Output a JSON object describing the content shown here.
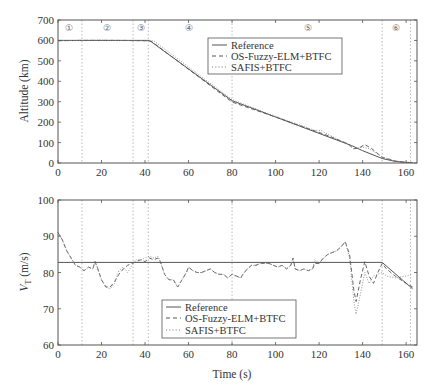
{
  "chart_data": [
    {
      "type": "line",
      "title": "",
      "xlabel": "",
      "ylabel": "Altitude (km)",
      "xlim": [
        0,
        165
      ],
      "ylim": [
        0,
        700
      ],
      "xticks": [
        0,
        20,
        40,
        60,
        80,
        100,
        120,
        140,
        160
      ],
      "yticks": [
        0,
        100,
        200,
        300,
        400,
        500,
        600,
        700
      ],
      "grid": false,
      "legend_position": "upper right",
      "phase_lines_x": [
        11,
        34.5,
        41.5,
        80,
        149,
        162
      ],
      "phase_labels": [
        {
          "label": "①",
          "x": 5
        },
        {
          "label": "②",
          "x": 22.5
        },
        {
          "label": "③",
          "x": 38
        },
        {
          "label": "④",
          "x": 60
        },
        {
          "label": "⑤",
          "x": 115
        },
        {
          "label": "⑥",
          "x": 155.5
        }
      ],
      "series": [
        {
          "name": "Reference",
          "style": "solid",
          "x": [
            0,
            42,
            80,
            100,
            120,
            135,
            140,
            149,
            155,
            160,
            163
          ],
          "y": [
            600,
            600,
            305,
            225,
            145,
            85,
            60,
            22,
            8,
            3,
            2
          ]
        },
        {
          "name": "OS-Fuzzy-ELM+BTFC",
          "style": "dashed",
          "x": [
            0,
            10,
            20,
            30,
            41,
            43,
            80,
            100,
            115,
            120,
            125,
            133,
            136,
            138,
            141,
            144,
            149,
            155,
            160,
            163
          ],
          "y": [
            598,
            600,
            600,
            600,
            598,
            595,
            298,
            225,
            168,
            150,
            130,
            95,
            70,
            72,
            90,
            72,
            28,
            10,
            3,
            2
          ]
        },
        {
          "name": "SAFIS+BTFC",
          "style": "dotted",
          "x": [
            0,
            10,
            20,
            30,
            41,
            44,
            80,
            100,
            118,
            121,
            125,
            133,
            136,
            140,
            143,
            149,
            155,
            160,
            163
          ],
          "y": [
            600,
            600,
            601,
            599,
            598,
            598,
            310,
            228,
            160,
            158,
            135,
            92,
            68,
            78,
            70,
            30,
            10,
            3,
            2
          ]
        }
      ]
    },
    {
      "type": "line",
      "title": "",
      "xlabel": "Time (s)",
      "ylabel": "V_T (m/s)",
      "ylabel_main": "V",
      "ylabel_sub": "T",
      "ylabel_unit": " (m/s)",
      "xlim": [
        0,
        165
      ],
      "ylim": [
        60,
        100
      ],
      "xticks": [
        0,
        20,
        40,
        60,
        80,
        100,
        120,
        140,
        160
      ],
      "yticks": [
        60,
        70,
        80,
        90,
        100
      ],
      "grid": false,
      "legend_position": "lower center",
      "phase_lines_x": [
        11,
        34.5,
        41.5,
        80,
        149,
        162
      ],
      "series": [
        {
          "name": "Reference",
          "style": "solid",
          "x": [
            0,
            149,
            163
          ],
          "y": [
            82.8,
            82.8,
            75.5
          ]
        },
        {
          "name": "OS-Fuzzy-ELM+BTFC",
          "style": "dashed",
          "x": [
            0,
            2,
            4,
            6,
            8,
            10,
            12,
            14,
            16,
            17,
            18,
            20,
            22,
            24,
            26,
            28,
            30,
            32,
            34,
            36,
            38,
            40,
            42,
            44,
            46,
            47,
            49,
            51,
            53,
            55,
            57,
            59,
            60,
            62,
            64,
            66,
            68,
            70,
            72,
            74,
            76,
            78,
            80,
            82,
            84,
            85,
            87,
            89,
            91,
            93,
            95,
            97,
            99,
            101,
            103,
            105,
            107,
            108,
            109,
            111,
            113,
            115,
            117,
            118,
            120,
            122,
            124,
            126,
            128,
            130,
            132,
            134,
            136,
            137,
            139,
            141,
            143,
            145,
            147,
            149,
            151,
            155,
            160,
            163
          ],
          "y": [
            91,
            89,
            86,
            84,
            82,
            81.5,
            80.5,
            81.5,
            81,
            83,
            81.5,
            78,
            76,
            76,
            77.5,
            79.5,
            81,
            82,
            82.5,
            83,
            83.5,
            83,
            84,
            83.5,
            84,
            83,
            79.5,
            78,
            78,
            76,
            78,
            80,
            81.5,
            80.5,
            80,
            80,
            80.5,
            81,
            80,
            79.5,
            79.5,
            78.5,
            79.5,
            79,
            78.5,
            79.5,
            81,
            82,
            82,
            82.5,
            82.5,
            82.5,
            82,
            81.5,
            82,
            81,
            82,
            84,
            81,
            80.5,
            81,
            80.5,
            81,
            82.5,
            82.5,
            84,
            85,
            85.5,
            86,
            87,
            88.5,
            85,
            75,
            72,
            78,
            83,
            79,
            77,
            80,
            82.5,
            81,
            79,
            77,
            76
          ]
        },
        {
          "name": "SAFIS+BTFC",
          "style": "dotted",
          "x": [
            0,
            2,
            4,
            6,
            8,
            10,
            12,
            14,
            16,
            17,
            18,
            20,
            22,
            24,
            26,
            28,
            30,
            32,
            34,
            36,
            38,
            40,
            42,
            44,
            46,
            47,
            49,
            51,
            53,
            55,
            57,
            59,
            60,
            62,
            64,
            66,
            68,
            70,
            72,
            74,
            76,
            78,
            80,
            82,
            84,
            85,
            87,
            89,
            91,
            93,
            95,
            97,
            99,
            101,
            103,
            105,
            107,
            108,
            109,
            111,
            113,
            115,
            117,
            118,
            120,
            122,
            124,
            126,
            128,
            130,
            132,
            134,
            136,
            137,
            139,
            141,
            143,
            145,
            147,
            149,
            151,
            155,
            160,
            163
          ],
          "y": [
            91,
            89,
            86,
            84,
            82,
            81.5,
            80.5,
            81.5,
            81,
            83,
            81.5,
            78,
            76,
            75.5,
            77,
            80.5,
            81.5,
            80,
            82,
            83.5,
            83.5,
            84,
            84.5,
            84,
            84.5,
            83,
            79.5,
            78,
            78,
            76,
            78,
            80,
            81.5,
            80.5,
            80,
            80,
            80.5,
            81,
            80,
            79.5,
            79.5,
            78.5,
            79.5,
            79,
            78.5,
            79.5,
            81,
            82,
            82,
            82.5,
            82.5,
            82.5,
            82,
            81.5,
            82,
            81,
            82,
            84,
            81,
            80.5,
            81,
            80.5,
            81,
            83.5,
            82.5,
            84,
            85,
            85.5,
            86,
            87,
            88.5,
            84,
            72,
            68.5,
            74,
            80,
            77,
            79,
            79.5,
            80,
            79,
            78.5,
            79,
            79.5
          ]
        }
      ]
    }
  ],
  "top": {
    "ylabel": "Altitude (km)",
    "legend": [
      "Reference",
      "OS-Fuzzy-ELM+BTFC",
      "SAFIS+BTFC"
    ]
  },
  "bottom": {
    "xlabel": "Time (s)",
    "legend": [
      "Reference",
      "OS-Fuzzy-ELM+BTFC",
      "SAFIS+BTFC"
    ]
  },
  "colors": {
    "reference": "#555555",
    "fuzzy": "#555555",
    "safis": "#888888",
    "axis": "#555555",
    "phase": "#aaaaaa"
  }
}
